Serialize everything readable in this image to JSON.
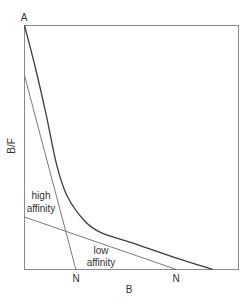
{
  "chart_data": {
    "type": "line",
    "title": "",
    "xlabel": "B",
    "ylabel": "B/F",
    "origin_label": "A",
    "xlim": [
      0,
      1
    ],
    "ylim": [
      0,
      1
    ],
    "grid": false,
    "series": [
      {
        "name": "total binding (observed curve)",
        "kind": "curve",
        "points": [
          [
            0,
            1.0
          ],
          [
            0.05,
            0.83
          ],
          [
            0.1,
            0.64
          ],
          [
            0.15,
            0.43
          ],
          [
            0.2,
            0.3
          ],
          [
            0.28,
            0.2
          ],
          [
            0.36,
            0.15
          ],
          [
            0.5,
            0.11
          ],
          [
            0.7,
            0.05
          ],
          [
            0.88,
            0.0
          ]
        ]
      },
      {
        "name": "high affinity",
        "kind": "line",
        "points": [
          [
            0,
            0.795
          ],
          [
            0.24,
            0.0
          ]
        ],
        "x_intercept_label": "N"
      },
      {
        "name": "low affinity",
        "kind": "line",
        "points": [
          [
            0,
            0.215
          ],
          [
            0.71,
            0.0
          ]
        ],
        "x_intercept_label": "N"
      }
    ],
    "annotations": [
      {
        "text_lines": [
          "high",
          "affinity"
        ],
        "refers_to": "high affinity"
      },
      {
        "text_lines": [
          "low",
          "affinity"
        ],
        "refers_to": "low affinity"
      }
    ]
  }
}
